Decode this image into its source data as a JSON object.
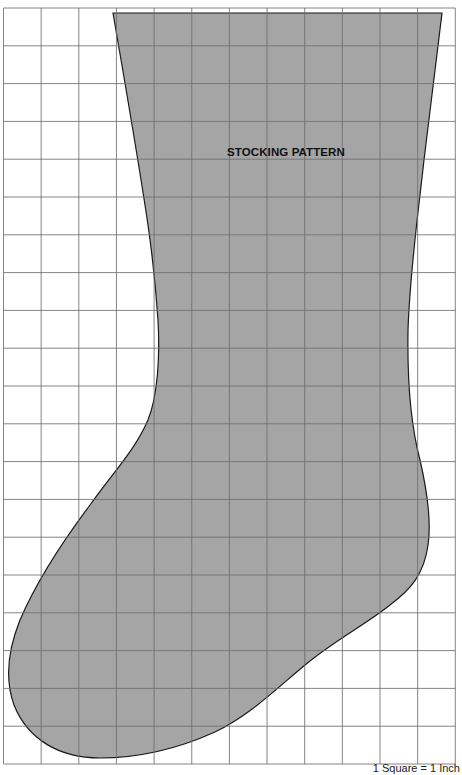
{
  "diagram": {
    "title": "STOCKING PATTERN",
    "scale_note": "1 Square = 1 Inch",
    "grid": {
      "columns": 12,
      "rows": 20,
      "left": 3.5,
      "top": 8,
      "cell_width": 37.65,
      "cell_height": 37.8,
      "line_color": "#6e6e6e",
      "background": "#ffffff"
    },
    "shape": {
      "name": "stocking",
      "fill_color": "#a5a5a5",
      "stroke_color": "#1a1a1a"
    }
  }
}
